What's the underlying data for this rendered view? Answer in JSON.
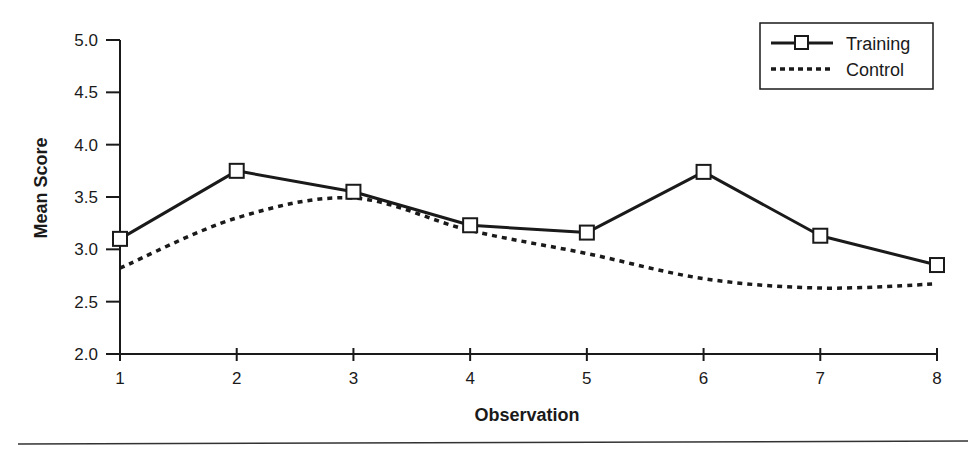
{
  "chart_data": {
    "type": "line",
    "title": "",
    "xlabel": "Observation",
    "ylabel": "Mean Score",
    "x": [
      1,
      2,
      3,
      4,
      5,
      6,
      7,
      8
    ],
    "x_ticks": [
      "1",
      "2",
      "3",
      "4",
      "5",
      "6",
      "7",
      "8"
    ],
    "y_ticks": [
      "2.0",
      "2.5",
      "3.0",
      "3.5",
      "4.0",
      "4.5",
      "5.0"
    ],
    "ylim": [
      2.0,
      5.0
    ],
    "xlim": [
      1,
      8
    ],
    "grid": false,
    "legend_position": "upper right",
    "series": [
      {
        "name": "Training",
        "style": "solid",
        "marker": "open-square",
        "color": "#1a1a1a",
        "values": [
          3.1,
          3.75,
          3.55,
          3.23,
          3.16,
          3.74,
          3.13,
          2.85
        ]
      },
      {
        "name": "Control",
        "style": "dotted",
        "marker": "none",
        "color": "#1a1a1a",
        "values": [
          2.82,
          3.3,
          3.49,
          3.18,
          2.96,
          2.72,
          2.63,
          2.67
        ]
      }
    ]
  },
  "legend": {
    "items": [
      {
        "label": "Training"
      },
      {
        "label": "Control"
      }
    ]
  },
  "axes": {
    "x_title": "Observation",
    "y_title": "Mean Score"
  }
}
